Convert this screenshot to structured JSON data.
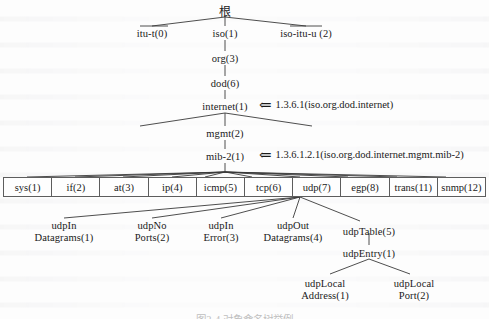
{
  "figure": {
    "caption": "图2-4 对象命名树举例"
  },
  "tree": {
    "root": {
      "label": "根",
      "x": 225,
      "y": 6
    },
    "level1": [
      {
        "label": "itu-t(0)",
        "x": 152,
        "y": 28
      },
      {
        "label": "iso(1)",
        "x": 225,
        "y": 28
      },
      {
        "label": "iso-itu-u (2)",
        "x": 306,
        "y": 28
      }
    ],
    "spine": [
      {
        "label": "org(3)",
        "x": 225,
        "y": 53
      },
      {
        "label": "dod(6)",
        "x": 225,
        "y": 78
      },
      {
        "label": "internet(1)",
        "x": 225,
        "y": 101
      },
      {
        "label": "mgmt(2)",
        "x": 225,
        "y": 128
      },
      {
        "label": "mib-2(1)",
        "x": 225,
        "y": 151
      }
    ]
  },
  "annotations": [
    {
      "arrow": "⇐",
      "text": "1.3.6.1(iso.org.dod.internet)",
      "x": 259,
      "y": 99
    },
    {
      "arrow": "⇐",
      "text": "1.3.6.1.2.1(iso.org.dod.internet.mgmt.mib-2)",
      "x": 259,
      "y": 149
    }
  ],
  "mib_table": {
    "cells": [
      "sys(1)",
      "if(2)",
      "at(3)",
      "ip(4)",
      "icmp(5)",
      "tcp(6)",
      "udp(7)",
      "egp(8)",
      "trans(11)",
      "snmp(12)"
    ]
  },
  "udp_children": [
    {
      "line1": "udpIn",
      "line2": "Datagrams(1)",
      "x": 64,
      "y": 220
    },
    {
      "line1": "udpNo",
      "line2": "Ports(2)",
      "x": 152,
      "y": 220
    },
    {
      "line1": "udpIn",
      "line2": "Error(3)",
      "x": 221,
      "y": 220
    },
    {
      "line1": "udpOut",
      "line2": "Datagrams(4)",
      "x": 293,
      "y": 220
    },
    {
      "line1": "udpTable(5)",
      "line2": "",
      "x": 369,
      "y": 226
    }
  ],
  "udp_entry": {
    "label": "udpEntry(1)",
    "x": 369,
    "y": 248
  },
  "udp_entry_children": [
    {
      "line1": "udpLocal",
      "line2": "Address(1)",
      "x": 325,
      "y": 278
    },
    {
      "line1": "udpLocal",
      "line2": "Port(2)",
      "x": 414,
      "y": 278
    }
  ],
  "colors": {
    "ink": "#1a1a1a",
    "line": "#3a3a3a",
    "border": "#5d5d5d",
    "page": "#fdfdfd"
  }
}
